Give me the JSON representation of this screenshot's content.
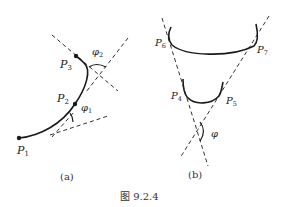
{
  "figure": {
    "caption": "图 9.2.4",
    "panels": [
      {
        "id": "a",
        "label": "(a)",
        "points": [
          {
            "name": "P",
            "sub": "1"
          },
          {
            "name": "P",
            "sub": "2"
          },
          {
            "name": "P",
            "sub": "3"
          }
        ],
        "angles": [
          {
            "name": "φ",
            "sub": "1"
          },
          {
            "name": "φ",
            "sub": "2"
          }
        ]
      },
      {
        "id": "b",
        "label": "(b)",
        "points": [
          {
            "name": "P",
            "sub": "4"
          },
          {
            "name": "P",
            "sub": "5"
          },
          {
            "name": "P",
            "sub": "6"
          },
          {
            "name": "P",
            "sub": "7"
          }
        ],
        "angles": [
          {
            "name": "φ",
            "sub": ""
          }
        ]
      }
    ]
  },
  "colors": {
    "stroke": "#1a1a1a",
    "dashed": "#333333",
    "background": "#ffffff"
  }
}
